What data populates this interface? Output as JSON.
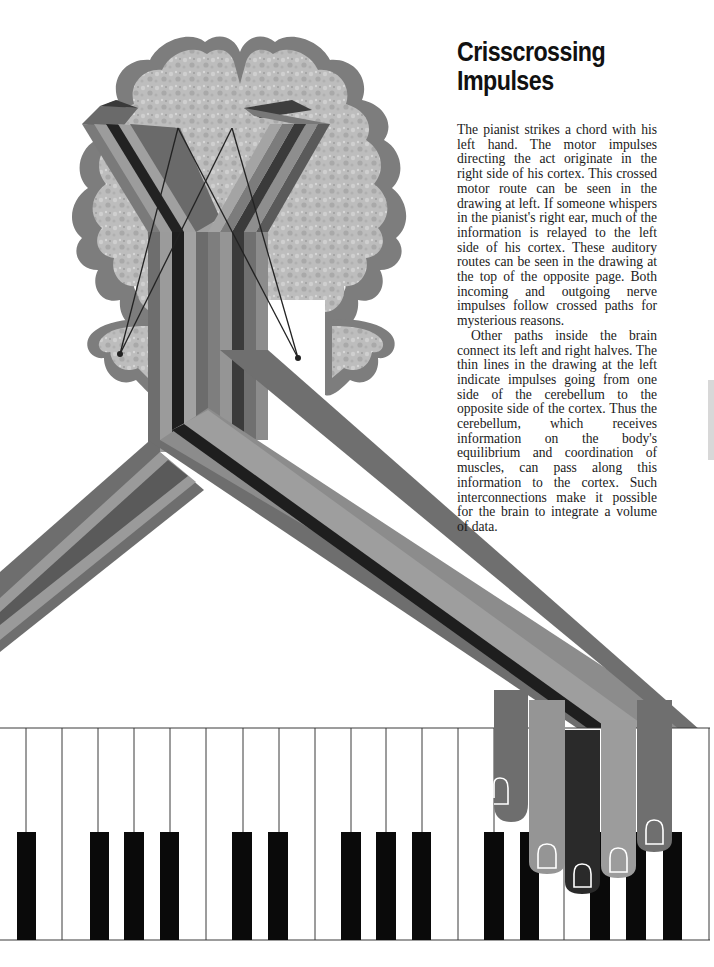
{
  "article": {
    "title_line1": "Crisscrossing",
    "title_line2": "Impulses",
    "paragraphs": [
      "The pianist strikes a chord with his left hand. The motor impulses directing the act originate in the right side of his cortex. This crossed motor route can be seen in the drawing at left. If someone whispers in the pianist's right ear, much of the information is relayed to the left side of his cortex. These auditory routes can be seen in the drawing at the top of the opposite page. Both incoming and outgoing nerve impulses follow crossed paths for mysterious reasons.",
      "Other paths inside the brain connect its left and right halves. The thin lines in the drawing at the left indicate impulses going from one side of the cerebellum to the opposite side of the cortex. Thus the cerebellum, which receives information on the body's equilibrium and coordination of muscles, can pass along this information to the cortex. Such interconnections make it possible for the brain to integrate a volume of data."
    ]
  },
  "illustration": {
    "subject": "brain-with-crossed-motor-pathways-to-hand-on-piano",
    "colors": {
      "brain_fill": "#b9b9b9",
      "brain_outline": "#7a7a7a",
      "band_dark": "#1e1e1e",
      "band_mid_dark": "#555555",
      "band_mid": "#6f6f6f",
      "band_light": "#9a9a9a",
      "band_lighter": "#8a8a8a",
      "piano_black": "#0a0a0a",
      "piano_line": "#3a3a3a"
    },
    "finger_count": 5,
    "piano": {
      "white_key_width": 36,
      "black_key_positions": [
        18,
        90,
        124,
        160,
        232,
        268,
        340,
        376,
        412,
        484,
        520,
        591,
        628,
        664
      ]
    }
  }
}
